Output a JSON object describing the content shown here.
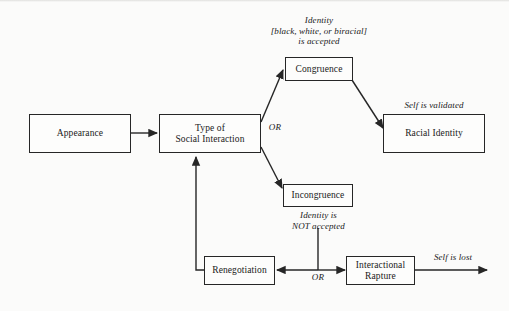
{
  "diagram": {
    "background_color": "#fbfbfa",
    "stroke_color": "#262626",
    "text_color": "#1a1a1a",
    "nodes": [
      {
        "id": "appearance",
        "label": "Appearance",
        "line1": "Appearance",
        "line2": ""
      },
      {
        "id": "interaction",
        "label": "Type of Social Interaction",
        "line1": "Type of",
        "line2": "Social Interaction"
      },
      {
        "id": "congruence",
        "label": "Congruence",
        "line1": "Congruence",
        "line2": ""
      },
      {
        "id": "racial",
        "label": "Racial Identity",
        "line1": "Racial Identity",
        "line2": ""
      },
      {
        "id": "incongruence",
        "label": "Incongruence",
        "line1": "Incongruence",
        "line2": ""
      },
      {
        "id": "renegotiation",
        "label": "Renegotiation",
        "line1": "Renegotiation",
        "line2": ""
      },
      {
        "id": "rapture",
        "label": "Interactional Rapture",
        "line1": "Interactional",
        "line2": "Rapture"
      }
    ],
    "edge_labels": [
      {
        "id": "identity-accepted",
        "text": "Identity\n[black, white, or biracial]\nis accepted"
      },
      {
        "id": "self-is-validated",
        "text": "Self is validated"
      },
      {
        "id": "identity-not-accepted",
        "text": "Identity is\nNOT accepted"
      },
      {
        "id": "self-is-lost",
        "text": "Self is lost"
      }
    ],
    "or_labels": [
      {
        "id": "or-branch-top",
        "text": "OR"
      },
      {
        "id": "or-branch-bottom",
        "text": "OR"
      }
    ]
  }
}
